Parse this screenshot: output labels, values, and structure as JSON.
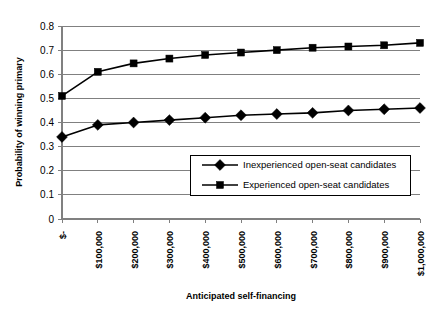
{
  "chart_data": {
    "type": "line",
    "title": "",
    "xlabel": "Anticipated self-financing",
    "ylabel": "Probability of winning primary",
    "categories": [
      "$-",
      "$100,000",
      "$200,000",
      "$300,000",
      "$400,000",
      "$500,000",
      "$600,000",
      "$700,000",
      "$800,000",
      "$900,000",
      "$1,000,000"
    ],
    "x": [
      0,
      100000,
      200000,
      300000,
      400000,
      500000,
      600000,
      700000,
      800000,
      900000,
      1000000
    ],
    "ylim": [
      0,
      0.8
    ],
    "yticks": [
      0,
      0.1,
      0.2,
      0.3,
      0.4,
      0.5,
      0.6,
      0.7,
      0.8
    ],
    "ytick_labels": [
      "0",
      "0.1",
      "0.2",
      "0.3",
      "0.4",
      "0.5",
      "0.6",
      "0.7",
      "0.8"
    ],
    "grid": true,
    "legend_position": "lower-right-inside",
    "series": [
      {
        "name": "Inexperienced open-seat candidates",
        "marker": "diamond",
        "color": "#000000",
        "values": [
          0.34,
          0.39,
          0.4,
          0.41,
          0.42,
          0.43,
          0.435,
          0.44,
          0.45,
          0.455,
          0.46
        ]
      },
      {
        "name": "Experienced open-seat candidates",
        "marker": "square",
        "color": "#000000",
        "values": [
          0.51,
          0.61,
          0.645,
          0.665,
          0.68,
          0.69,
          0.7,
          0.71,
          0.715,
          0.72,
          0.73
        ]
      }
    ]
  },
  "legend": {
    "entries": [
      {
        "label": "Inexperienced open-seat candidates",
        "marker": "diamond"
      },
      {
        "label": "Experienced open-seat candidates",
        "marker": "square"
      }
    ]
  },
  "colors": {
    "series": "#000000",
    "grid": "#808080",
    "axis": "#808080",
    "background": "#ffffff"
  }
}
